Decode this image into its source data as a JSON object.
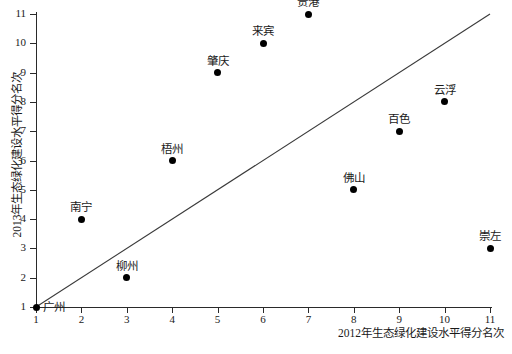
{
  "chart_data": {
    "type": "scatter",
    "title": "",
    "xlabel": "2012年生态绿化建设水平得分名次",
    "ylabel": "2013年生态绿化建设水平得分名次",
    "xlim": [
      1,
      11
    ],
    "ylim": [
      1,
      11
    ],
    "xticks": [
      "1",
      "2",
      "3",
      "4",
      "5",
      "6",
      "7",
      "8",
      "9",
      "10",
      "11"
    ],
    "yticks": [
      "1",
      "2",
      "3",
      "4",
      "5",
      "6",
      "7",
      "8",
      "9",
      "10",
      "11"
    ],
    "grid": false,
    "legend": "none",
    "marker_color": "#000000",
    "line_color": "#3a3a3a",
    "reference_line": {
      "name": "diagonal-y-equals-x",
      "x": [
        1,
        11
      ],
      "y": [
        1,
        11
      ]
    },
    "points": [
      {
        "label": "广州",
        "x": 1,
        "y": 1,
        "label_pos": "right"
      },
      {
        "label": "南宁",
        "x": 2,
        "y": 4,
        "label_pos": "above"
      },
      {
        "label": "柳州",
        "x": 3,
        "y": 2,
        "label_pos": "above"
      },
      {
        "label": "梧州",
        "x": 4,
        "y": 6,
        "label_pos": "above"
      },
      {
        "label": "肇庆",
        "x": 5,
        "y": 9,
        "label_pos": "above"
      },
      {
        "label": "来宾",
        "x": 6,
        "y": 10,
        "label_pos": "above"
      },
      {
        "label": "贵港",
        "x": 7,
        "y": 11,
        "label_pos": "above"
      },
      {
        "label": "佛山",
        "x": 8,
        "y": 5,
        "label_pos": "above"
      },
      {
        "label": "百色",
        "x": 9,
        "y": 7,
        "label_pos": "above"
      },
      {
        "label": "云浮",
        "x": 10,
        "y": 8,
        "label_pos": "above"
      },
      {
        "label": "崇左",
        "x": 11,
        "y": 3,
        "label_pos": "above"
      }
    ]
  },
  "caption": ""
}
